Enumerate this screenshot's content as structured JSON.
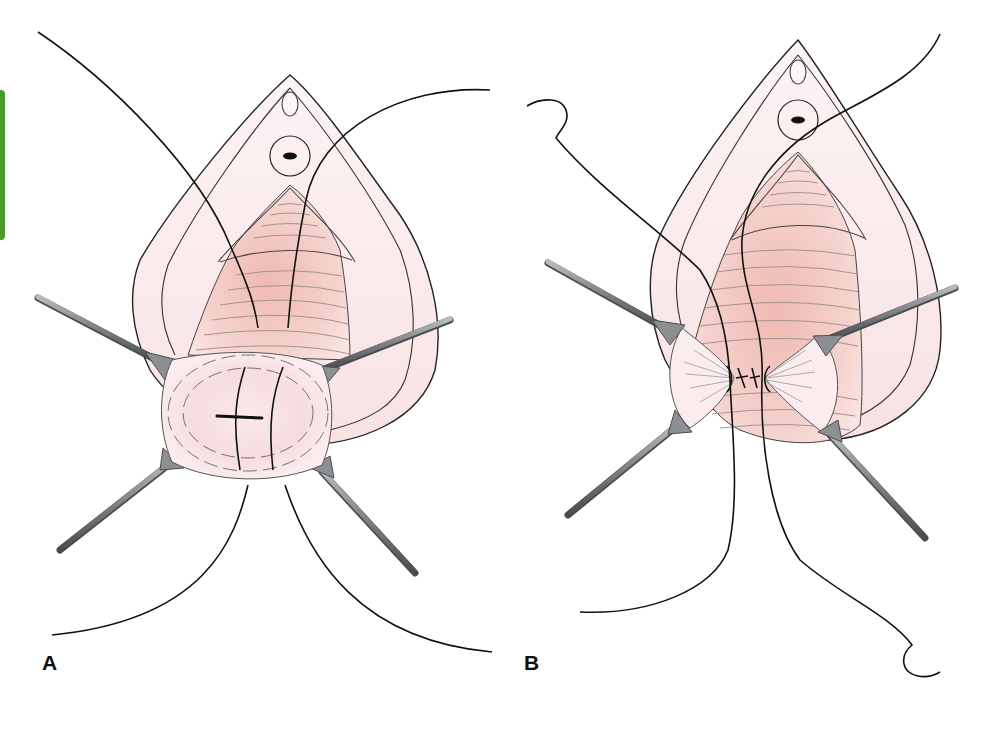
{
  "figure": {
    "panels": [
      {
        "id": "A",
        "label": "A",
        "offset_x": 0
      },
      {
        "id": "B",
        "label": "B",
        "offset_x": 508
      }
    ],
    "colors": {
      "skin": "#fbeef0",
      "tissue": "#f3c9c2",
      "tissue_dark": "#e9aea7",
      "outline": "#222222",
      "fold_line": "#8a8a8a",
      "suture": "#111111",
      "retractor": "#8d9092",
      "retractor_edge": "#4a4c4e",
      "accent_tab": "#4c9a2a"
    },
    "icons": {
      "retractor": "retractor-icon",
      "suture": "suture-icon"
    }
  }
}
